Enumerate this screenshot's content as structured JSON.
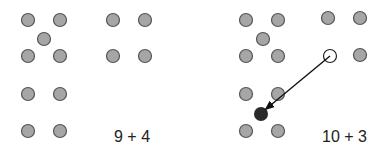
{
  "panels": [
    {
      "label": "9 + 4",
      "colors": {
        "dot_fill": "#a6a6a6",
        "dot_stroke": "#555555"
      },
      "dots": [
        {
          "x": 28,
          "y": 20
        },
        {
          "x": 60,
          "y": 20
        },
        {
          "x": 44,
          "y": 39
        },
        {
          "x": 28,
          "y": 56
        },
        {
          "x": 60,
          "y": 56
        },
        {
          "x": 28,
          "y": 94
        },
        {
          "x": 60,
          "y": 94
        },
        {
          "x": 28,
          "y": 131
        },
        {
          "x": 60,
          "y": 131
        },
        {
          "x": 113,
          "y": 20
        },
        {
          "x": 145,
          "y": 20
        },
        {
          "x": 113,
          "y": 56
        },
        {
          "x": 145,
          "y": 56
        }
      ]
    },
    {
      "label": "10 + 3",
      "dots": [
        {
          "x": 246,
          "y": 20
        },
        {
          "x": 278,
          "y": 20
        },
        {
          "x": 263,
          "y": 39
        },
        {
          "x": 246,
          "y": 56
        },
        {
          "x": 278,
          "y": 56
        },
        {
          "x": 246,
          "y": 94
        },
        {
          "x": 278,
          "y": 94
        },
        {
          "x": 246,
          "y": 131
        },
        {
          "x": 278,
          "y": 131
        },
        {
          "x": 328,
          "y": 18
        },
        {
          "x": 360,
          "y": 18
        },
        {
          "x": 360,
          "y": 55
        }
      ],
      "moved_from": {
        "x": 330,
        "y": 56
      },
      "moved_to": {
        "x": 261,
        "y": 114
      }
    }
  ]
}
